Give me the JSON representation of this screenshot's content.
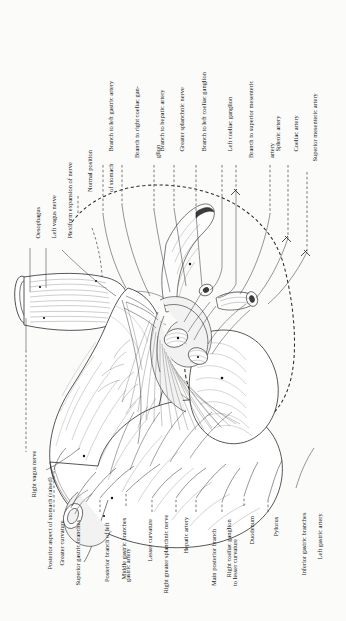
{
  "plate": {
    "title": "Nerve and arterial supply of the stomach (posterior aspect, stomach raised)",
    "background_color": "#fbfbfa",
    "ink_color": "#1d1d1d"
  },
  "labels_top": [
    {
      "text": "Branch to left gastric artery",
      "lines": [
        "Branch to left gastric artery"
      ]
    },
    {
      "text": "Branch to right coeliac ganglion",
      "lines": [
        "Branch to right coeliac gan-",
        "glion"
      ]
    },
    {
      "text": "Branch to hepatic artery",
      "lines": [
        "Branch to hepatic artery"
      ]
    },
    {
      "text": "Greater splanchnic nerve",
      "lines": [
        "Greater splanchnic nerve"
      ]
    },
    {
      "text": "Branch to left coeliac ganglion",
      "lines": [
        "Branch to left coeliac ganglion"
      ]
    },
    {
      "text": "Left coeliac ganglion",
      "lines": [
        "Left coeliac ganglion"
      ]
    },
    {
      "text": "Branch to superior mesenteric artery",
      "lines": [
        "Branch to superior mesenteric",
        "artery"
      ]
    },
    {
      "text": "Splenic artery",
      "lines": [
        "Splenic artery"
      ]
    },
    {
      "text": "Coeliac artery",
      "lines": [
        "Coeliac artery"
      ]
    },
    {
      "text": "Superior mesenteric artery",
      "lines": [
        "Superior mesenteric artery"
      ]
    }
  ],
  "labels_upper_left": [
    {
      "text": "Oesophagus",
      "lines": [
        "Oesophagus"
      ]
    },
    {
      "text": "Left vagus nerve",
      "lines": [
        "Left vagus nerve"
      ]
    },
    {
      "text": "Plexiform expansion of nerve",
      "lines": [
        "Plexiform expansion of nerve"
      ]
    },
    {
      "text": "Normal position of stomach",
      "lines": [
        "Normal position",
        "of stomach"
      ]
    }
  ],
  "labels_lower_left": [
    {
      "text": "Right vagus nerve",
      "lines": [
        "Right vagus nerve"
      ]
    },
    {
      "text": "Posterior aspect of stomach (raised)",
      "lines": [
        "Posterior aspect of stomach (raised)"
      ]
    }
  ],
  "labels_bottom": [
    {
      "text": "Greater curvature",
      "lines": [
        "Greater curvature"
      ]
    },
    {
      "text": "Superior gastric branches",
      "lines": [
        "Superior gastric branches"
      ]
    },
    {
      "text": "Posterior branch of left gastric artery",
      "lines": [
        "Posterior branch of left",
        "gastric artery"
      ]
    },
    {
      "text": "Middle gastric branches",
      "lines": [
        "Middle gastric branches"
      ]
    },
    {
      "text": "Lesser curvature",
      "lines": [
        "Lesser curvature"
      ]
    },
    {
      "text": "Right greater splanchnic nerve",
      "lines": [
        "Right greater splanchnic nerve"
      ]
    },
    {
      "text": "Hepatic artery",
      "lines": [
        "Hepatic artery"
      ]
    },
    {
      "text": "Main posterior branch to lesser curvature",
      "lines": [
        "Main posterior branch",
        "to lesser curvature"
      ]
    },
    {
      "text": "Right coeliac ganglion",
      "lines": [
        "Right coeliac ganglion"
      ]
    },
    {
      "text": "Duodenum",
      "lines": [
        "Duodenum"
      ]
    },
    {
      "text": "Pylorus",
      "lines": [
        "Pylorus"
      ]
    },
    {
      "text": "Inferior gastric branches",
      "lines": [
        "Inferior gastric branches"
      ]
    },
    {
      "text": "Left gastric artery",
      "lines": [
        "Left gastric artery"
      ]
    }
  ],
  "icons": {
    "leader_dashed": "dashed-leader-line",
    "leader_solid": "solid-leader-line",
    "normal_position_outline": "dashed-stomach-outline"
  }
}
